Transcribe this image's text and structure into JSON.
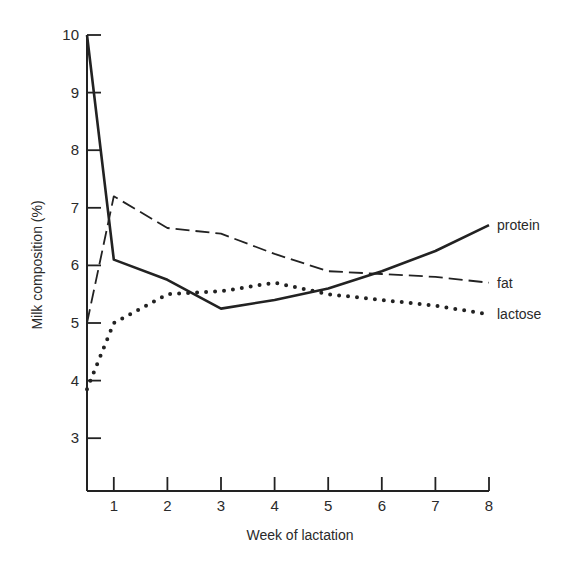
{
  "chart_data": {
    "type": "line",
    "title": "",
    "xlabel": "Week of lactation",
    "ylabel": "Milk composition (%)",
    "x_ticks": [
      1,
      2,
      3,
      4,
      5,
      6,
      7,
      8
    ],
    "y_ticks": [
      3,
      4,
      5,
      6,
      7,
      8,
      9,
      10
    ],
    "xlim": [
      0.5,
      8
    ],
    "ylim": [
      2.1,
      10
    ],
    "grid": false,
    "legend": "inline labels at line ends (right)",
    "x": [
      0.5,
      1,
      2,
      3,
      4,
      5,
      6,
      7,
      8
    ],
    "series": [
      {
        "name": "protein",
        "style": "solid",
        "values": [
          10.0,
          6.1,
          5.75,
          5.25,
          5.4,
          5.6,
          5.9,
          6.25,
          6.7
        ]
      },
      {
        "name": "fat",
        "style": "dashed",
        "values": [
          5.0,
          7.2,
          6.65,
          6.55,
          6.2,
          5.9,
          5.85,
          5.8,
          5.7
        ]
      },
      {
        "name": "lactose",
        "style": "dotted",
        "values": [
          3.85,
          5.0,
          5.5,
          5.55,
          5.7,
          5.5,
          5.4,
          5.3,
          5.15
        ]
      }
    ]
  },
  "colors": {
    "ink": "#222222",
    "background": "#ffffff"
  }
}
